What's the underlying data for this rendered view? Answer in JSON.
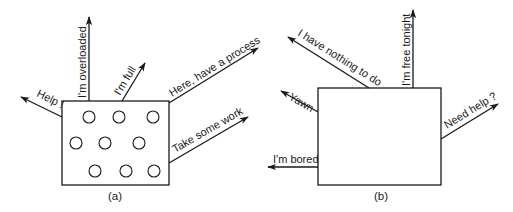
{
  "panels": {
    "a": {
      "caption": "(a)",
      "state": "overloaded",
      "process_count": 9,
      "arrows": {
        "help": "Help !",
        "overloaded": "I'm overloaded",
        "full": "I'm full",
        "have_process": "Here, have a process",
        "take_work": "Take some work"
      }
    },
    "b": {
      "caption": "(b)",
      "state": "underloaded",
      "process_count": 0,
      "arrows": {
        "nothing_to_do": "I have nothing to do",
        "free_tonight": "I'm free tonight",
        "yawn": "Yawn",
        "bored": "I'm bored",
        "need_help": "Need help ?"
      }
    }
  },
  "colors": {
    "line": "#1a1a1a",
    "background": "#ffffff"
  }
}
